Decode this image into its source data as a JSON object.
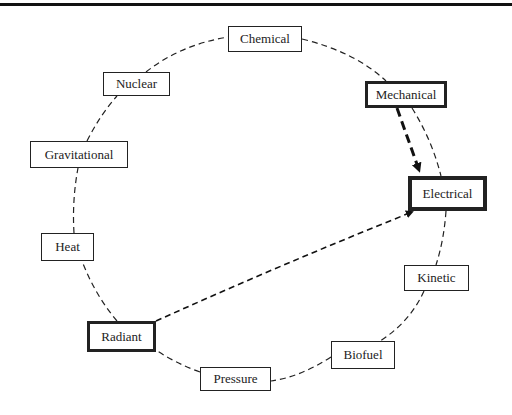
{
  "diagram": {
    "type": "energy-conversion-cycle",
    "nodes": [
      {
        "id": "chemical",
        "label": "Chemical",
        "x": 228,
        "y": 26,
        "w": 74,
        "h": 26,
        "emphasis": "normal"
      },
      {
        "id": "nuclear",
        "label": "Nuclear",
        "x": 103,
        "y": 72,
        "w": 67,
        "h": 24,
        "emphasis": "normal"
      },
      {
        "id": "mechanical",
        "label": "Mechanical",
        "x": 365,
        "y": 81,
        "w": 82,
        "h": 27,
        "emphasis": "medium"
      },
      {
        "id": "gravitational",
        "label": "Gravitational",
        "x": 30,
        "y": 141,
        "w": 98,
        "h": 27,
        "emphasis": "normal"
      },
      {
        "id": "electrical",
        "label": "Electrical",
        "x": 408,
        "y": 176,
        "w": 79,
        "h": 35,
        "emphasis": "thick"
      },
      {
        "id": "heat",
        "label": "Heat",
        "x": 41,
        "y": 233,
        "w": 53,
        "h": 28,
        "emphasis": "normal"
      },
      {
        "id": "kinetic",
        "label": "Kinetic",
        "x": 404,
        "y": 265,
        "w": 65,
        "h": 26,
        "emphasis": "normal"
      },
      {
        "id": "radiant",
        "label": "Radiant",
        "x": 87,
        "y": 321,
        "w": 69,
        "h": 31,
        "emphasis": "medium"
      },
      {
        "id": "biofuel",
        "label": "Biofuel",
        "x": 331,
        "y": 341,
        "w": 64,
        "h": 28,
        "emphasis": "normal"
      },
      {
        "id": "pressure",
        "label": "Pressure",
        "x": 200,
        "y": 367,
        "w": 71,
        "h": 24,
        "emphasis": "normal"
      }
    ],
    "cycle_edges": [
      {
        "from": "chemical",
        "to": "mechanical",
        "style": "dashed"
      },
      {
        "from": "mechanical",
        "to": "electrical",
        "style": "dashed"
      },
      {
        "from": "electrical",
        "to": "kinetic",
        "style": "dashed"
      },
      {
        "from": "kinetic",
        "to": "biofuel",
        "style": "dashed"
      },
      {
        "from": "biofuel",
        "to": "pressure",
        "style": "dashed"
      },
      {
        "from": "pressure",
        "to": "radiant",
        "style": "dashed"
      },
      {
        "from": "radiant",
        "to": "heat",
        "style": "dashed"
      },
      {
        "from": "heat",
        "to": "gravitational",
        "style": "dashed"
      },
      {
        "from": "gravitational",
        "to": "nuclear",
        "style": "dashed"
      },
      {
        "from": "nuclear",
        "to": "chemical",
        "style": "dashed"
      }
    ],
    "arrows": [
      {
        "from": "mechanical",
        "to": "electrical",
        "style": "thick-dashed-arrow"
      },
      {
        "from": "radiant",
        "to": "electrical",
        "style": "dashed-arrow"
      }
    ]
  }
}
